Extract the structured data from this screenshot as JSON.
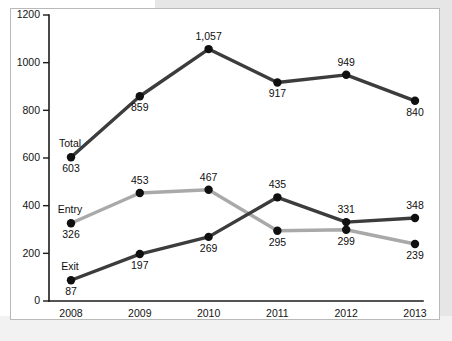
{
  "chart_data": {
    "type": "line",
    "title": "",
    "xlabel": "",
    "ylabel": "",
    "categories": [
      "2008",
      "2009",
      "2010",
      "2011",
      "2012",
      "2013"
    ],
    "ylim": [
      0,
      1200
    ],
    "yticks": [
      0,
      200,
      400,
      600,
      800,
      1000,
      1200
    ],
    "ytick_labels": [
      "0",
      "200",
      "400",
      "600",
      "800",
      "1000",
      "1200"
    ],
    "grid": false,
    "legend_position": "inline-left-labels",
    "series": [
      {
        "name": "Total",
        "color": "#3c3c3c",
        "marker_color": "#101010",
        "values": [
          603,
          859,
          1057,
          917,
          949,
          840
        ],
        "value_labels": [
          "603",
          "859",
          "1,057",
          "917",
          "949",
          "840"
        ],
        "label_positions": [
          "below",
          "below",
          "above",
          "below",
          "above",
          "below"
        ]
      },
      {
        "name": "Entry",
        "color": "#a9a9a9",
        "marker_color": "#101010",
        "values": [
          326,
          453,
          467,
          295,
          299,
          239
        ],
        "value_labels": [
          "326",
          "453",
          "467",
          "295",
          "299",
          "239"
        ],
        "label_positions": [
          "below",
          "above",
          "above",
          "below",
          "below",
          "below"
        ]
      },
      {
        "name": "Exit",
        "color": "#3c3c3c",
        "marker_color": "#101010",
        "values": [
          87,
          197,
          269,
          435,
          331,
          348
        ],
        "value_labels": [
          "87",
          "197",
          "269",
          "435",
          "331",
          "348"
        ],
        "label_positions": [
          "below",
          "below",
          "below",
          "above",
          "above",
          "above"
        ]
      }
    ],
    "series_name_anchors": [
      {
        "name": "Total",
        "series": 0
      },
      {
        "name": "Entry",
        "series": 1
      },
      {
        "name": "Exit",
        "series": 2
      }
    ]
  },
  "colors": {
    "panel_background": "#ffffff",
    "panel_border": "#b9b9b9",
    "page_band": "#e6e6e6",
    "axis": "#1b1b1b",
    "text": "#0f0f0f"
  }
}
